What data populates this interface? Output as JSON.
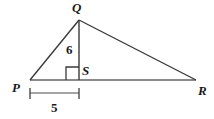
{
  "figure": {
    "kind": "geometry-triangle-with-altitude",
    "background_color": "#ffffff",
    "stroke_color_primary": "#3a3a3a",
    "stroke_color_base": "#8a8a8a",
    "stroke_color_dimension": "#4a4a4a",
    "text_color": "#1a1a1a"
  },
  "vertices": {
    "Q": {
      "label": "Q",
      "x": 79,
      "y": 20
    },
    "P": {
      "label": "P",
      "x": 30,
      "y": 80
    },
    "R": {
      "label": "R",
      "x": 196,
      "y": 80
    },
    "S": {
      "label": "S",
      "x": 79,
      "y": 80
    }
  },
  "measurements": {
    "altitude": {
      "label": "6",
      "from": "Q",
      "to": "S"
    },
    "base_segment": {
      "label": "5",
      "from": "P",
      "to": "S"
    }
  },
  "markers": {
    "right_angle": {
      "at": "S",
      "size": 12
    }
  }
}
